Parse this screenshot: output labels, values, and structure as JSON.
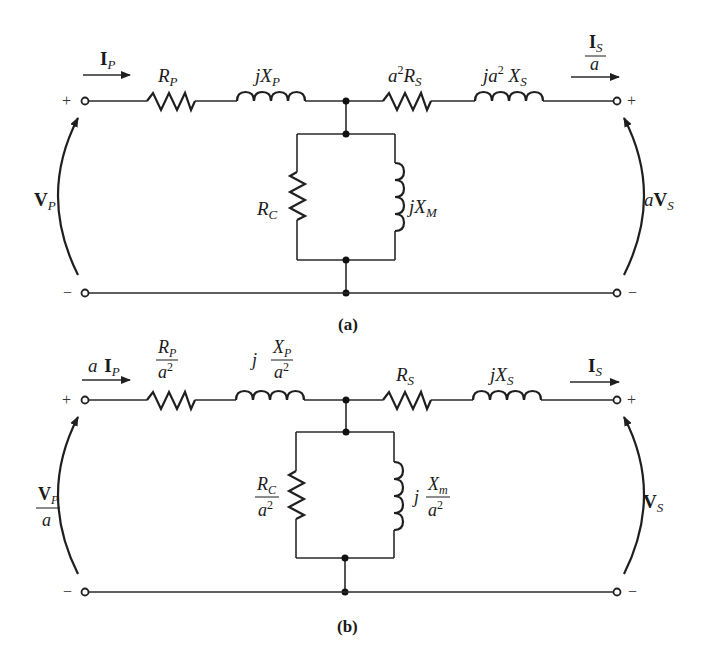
{
  "figure": {
    "colors": {
      "line": "#1f1f1f",
      "background": "#ffffff"
    }
  },
  "circuit_a": {
    "caption": "(a)",
    "current_in": {
      "main": "I",
      "sub": "P",
      "bold": true
    },
    "current_out": {
      "num_main": "I",
      "num_sub": "S",
      "den": "a"
    },
    "voltage_left": {
      "main": "V",
      "sub": "P"
    },
    "voltage_right": {
      "prefix": "a",
      "main": "V",
      "sub": "S"
    },
    "series_left_resistor": {
      "main": "R",
      "sub": "P"
    },
    "series_left_inductor": {
      "prefix": "j",
      "main": "X",
      "sub": "P"
    },
    "series_right_resistor": {
      "prefix": "a",
      "sup": "2",
      "main": "R",
      "sub": "S"
    },
    "series_right_inductor": {
      "prefix": "ja",
      "sup": "2",
      "main": " X",
      "sub": "S"
    },
    "shunt_resistor": {
      "main": "R",
      "sub": "C"
    },
    "shunt_inductor": {
      "prefix": "j",
      "main": "X",
      "sub": "M"
    },
    "terminal_plus": "+",
    "terminal_minus": "−"
  },
  "circuit_b": {
    "caption": "(b)",
    "current_in": {
      "prefix": "a ",
      "main": "I",
      "sub": "P"
    },
    "current_out": {
      "main": "I",
      "sub": "S"
    },
    "voltage_left": {
      "num_main": "V",
      "num_sub": "P",
      "den": "a"
    },
    "voltage_right": {
      "main": "V",
      "sub": "S"
    },
    "series_left_resistor": {
      "num_main": "R",
      "num_sub": "P",
      "den": "a",
      "den_sup": "2"
    },
    "series_left_inductor": {
      "prefix": "j",
      "num_main": "X",
      "num_sub": "P",
      "den": "a",
      "den_sup": "2"
    },
    "series_right_resistor": {
      "main": "R",
      "sub": "S"
    },
    "series_right_inductor": {
      "prefix": "j",
      "main": "X",
      "sub": "S"
    },
    "shunt_resistor": {
      "num_main": "R",
      "num_sub": "C",
      "den": "a",
      "den_sup": "2"
    },
    "shunt_inductor": {
      "prefix": "j",
      "num_main": "X",
      "num_sub": "m",
      "den": "a",
      "den_sup": "2"
    },
    "terminal_plus": "+",
    "terminal_minus": "−"
  }
}
